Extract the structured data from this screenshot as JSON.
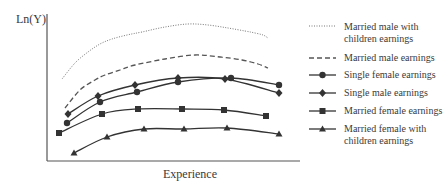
{
  "chart_data": {
    "type": "line",
    "title": "",
    "xlabel": "Experience",
    "ylabel": "Ln(Y)",
    "grid": false,
    "legend_position": "right",
    "axis_ticks": "none",
    "note": "Schematic curves; no numeric tick values are shown. Points are in pixel coordinates (x right, y down) of the plot area.",
    "series": [
      {
        "name": "Married male with children earnings",
        "style": "dotted",
        "marker": "none",
        "color": "#777777",
        "points": [
          [
            62,
            79
          ],
          [
            75,
            63
          ],
          [
            88,
            52
          ],
          [
            100,
            44
          ],
          [
            112,
            39
          ],
          [
            127,
            35
          ],
          [
            142,
            32
          ],
          [
            165,
            27
          ],
          [
            188,
            24
          ],
          [
            208,
            25
          ],
          [
            228,
            28
          ],
          [
            245,
            31
          ],
          [
            255,
            33
          ],
          [
            263,
            35
          ],
          [
            268,
            38
          ]
        ]
      },
      {
        "name": "Married male earnings",
        "style": "dashed",
        "marker": "none",
        "color": "#555555",
        "points": [
          [
            65,
            108
          ],
          [
            80,
            90
          ],
          [
            95,
            80
          ],
          [
            105,
            75
          ],
          [
            120,
            70
          ],
          [
            135,
            65
          ],
          [
            165,
            59
          ],
          [
            195,
            55
          ],
          [
            220,
            57
          ],
          [
            242,
            60
          ],
          [
            258,
            64
          ],
          [
            268,
            68
          ]
        ]
      },
      {
        "name": "Single female earnings",
        "style": "solid",
        "marker": "circle",
        "color": "#333333",
        "points": [
          [
            67,
            123
          ],
          [
            100,
            102
          ],
          [
            137,
            92
          ],
          [
            178,
            82
          ],
          [
            231,
            78
          ],
          [
            279,
            85
          ]
        ]
      },
      {
        "name": "Single male earnings",
        "style": "solid",
        "marker": "diamond",
        "color": "#333333",
        "points": [
          [
            68,
            114
          ],
          [
            98,
            96
          ],
          [
            135,
            85
          ],
          [
            178,
            78
          ],
          [
            225,
            79
          ],
          [
            279,
            93
          ]
        ]
      },
      {
        "name": "Married female earnings",
        "style": "solid",
        "marker": "square",
        "color": "#333333",
        "points": [
          [
            59,
            133
          ],
          [
            102,
            114
          ],
          [
            138,
            109
          ],
          [
            182,
            109
          ],
          [
            224,
            110
          ],
          [
            266,
            116
          ]
        ]
      },
      {
        "name": "Married female with children earnings",
        "style": "solid",
        "marker": "triangle",
        "color": "#333333",
        "points": [
          [
            74,
            153
          ],
          [
            107,
            137
          ],
          [
            144,
            129
          ],
          [
            184,
            129
          ],
          [
            227,
            128
          ],
          [
            279,
            134
          ]
        ]
      }
    ]
  },
  "axes": {
    "y_label": "Ln(Y)",
    "x_label": "Experience"
  },
  "legend": {
    "items": [
      {
        "line1": "Married male with",
        "line2": "children earnings"
      },
      {
        "line1": "Married male earnings"
      },
      {
        "line1": "Single female earnings"
      },
      {
        "line1": "Single male earnings"
      },
      {
        "line1": "Married female earnings"
      },
      {
        "line1": "Married female with",
        "line2": "children earnings"
      }
    ]
  }
}
